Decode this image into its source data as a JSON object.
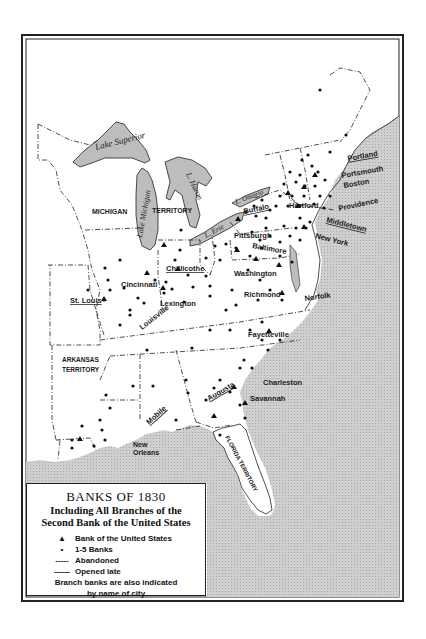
{
  "legend": {
    "title": "BANKS OF 1830",
    "subtitle_line1": "Including All Branches of the",
    "subtitle_line2": "Second Bank of the United States",
    "items": [
      {
        "symbol": "▲",
        "label": "Bank of the United States"
      },
      {
        "symbol": "•",
        "label": "1-5 Banks"
      },
      {
        "symbol": "-----",
        "label": "Abandoned"
      },
      {
        "symbol": "——",
        "label": "Opened late"
      }
    ],
    "note_line1": "Branch banks are also indicated",
    "note_line2": "by name of city"
  },
  "lakes": {
    "superior": "Lake Superior",
    "michigan": "Lake Michigan",
    "huron": "L. Huron",
    "erie": "L. Erie",
    "ontario": "L. Ontario"
  },
  "territories": {
    "michigan_1": "MICHIGAN",
    "michigan_2": "TERRITORY",
    "arkansas_1": "ARKANSAS",
    "arkansas_2": "TERRITORY",
    "florida": "FLORIDA TERRITORY"
  },
  "cities": {
    "portland": "Portland",
    "portsmouth": "Portsmouth",
    "boston": "Boston",
    "hartford": "Hartford",
    "providence": "Providence",
    "middletown": "Middletown",
    "new_york": "New York",
    "buffalo": "Buffalo",
    "pittsburgh": "Pittsburgh",
    "baltimore": "Baltimore",
    "washington": "Washington",
    "richmond": "Richmond",
    "norfolk": "Norfolk",
    "fayetteville": "Fayetteville",
    "chillicothe": "Chillicothe",
    "cincinnati": "Cincinnati",
    "lexington": "Lexington",
    "louisville": "Louisville",
    "st_louis": "St. Louis",
    "charleston": "Charleston",
    "savannah": "Savannah",
    "augusta": "Augusta",
    "mobile": "Mobile",
    "new_orleans_1": "New",
    "new_orleans_2": "Orleans"
  },
  "colors": {
    "water": "#c8c8c8",
    "land": "#ffffff",
    "ink": "#1a1a1a"
  }
}
